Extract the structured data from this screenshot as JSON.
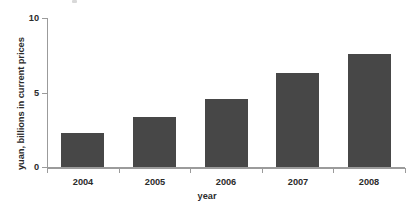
{
  "chart_data": {
    "type": "bar",
    "title": "",
    "subtitle": "",
    "xlabel": "year",
    "ylabel": "yuan, billions in current prices",
    "categories": [
      "2004",
      "2005",
      "2006",
      "2007",
      "2008"
    ],
    "values": [
      2.3,
      3.4,
      4.6,
      6.3,
      7.6
    ],
    "series": [
      {
        "name": "yuan, billions in current prices",
        "values": [
          2.3,
          3.4,
          4.6,
          6.3,
          7.6
        ]
      }
    ],
    "ylim": [
      0,
      10
    ],
    "ytick_labels": [
      "0",
      "5",
      "10"
    ],
    "ytick_values": [
      0,
      5,
      10
    ],
    "xtick_labels": [
      "2004",
      "2005",
      "2006",
      "2007",
      "2008"
    ],
    "grid": false,
    "legend": false,
    "legend_position": "none",
    "bar_color": "#474747",
    "axis_color": "#9b9b9b",
    "text_color": "#2b2b2b",
    "background_color": "#ffffff"
  }
}
